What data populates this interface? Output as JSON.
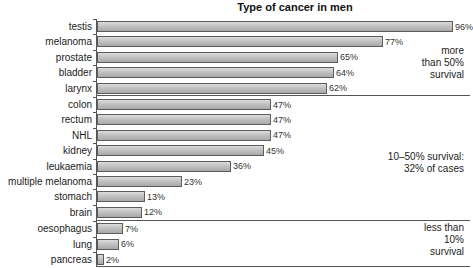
{
  "chart_data": {
    "type": "bar",
    "orientation": "horizontal",
    "title": "Type of cancer in men",
    "xlabel": "",
    "ylabel": "",
    "xlim": [
      0,
      100
    ],
    "grid": false,
    "unit": "%",
    "categories": [
      "testis",
      "melanoma",
      "prostate",
      "bladder",
      "larynx",
      "colon",
      "rectum",
      "NHL",
      "kidney",
      "leukaemia",
      "multiple melanoma",
      "stomach",
      "brain",
      "oesophagus",
      "lung",
      "pancreas"
    ],
    "values": [
      96,
      77,
      65,
      64,
      62,
      47,
      47,
      47,
      45,
      36,
      23,
      13,
      12,
      7,
      6,
      2
    ],
    "value_labels": [
      "96%",
      "77%",
      "65%",
      "64%",
      "62%",
      "47%",
      "47%",
      "47%",
      "45%",
      "36%",
      "23%",
      "13%",
      "12%",
      "7%",
      "6%",
      "2%"
    ],
    "groups": [
      {
        "annotation": "more than 50% survival",
        "lines": [
          "more",
          "than 50%",
          "survival"
        ],
        "members": [
          "testis",
          "melanoma",
          "prostate",
          "bladder",
          "larynx"
        ]
      },
      {
        "annotation": "10–50% survival: 32% of cases",
        "lines": [
          "10–50% survival:",
          "32% of cases"
        ],
        "members": [
          "colon",
          "rectum",
          "NHL",
          "kidney",
          "leukaemia",
          "multiple melanoma",
          "stomach",
          "brain"
        ]
      },
      {
        "annotation": "less than 10% survival",
        "lines": [
          "less than",
          "10%",
          "survival"
        ],
        "members": [
          "oesophagus",
          "lung",
          "pancreas"
        ]
      }
    ]
  },
  "colors": {
    "bar_fill": "#bdbdbd",
    "bar_border": "#5c5c5c",
    "axis": "#555555",
    "text": "#222222"
  }
}
